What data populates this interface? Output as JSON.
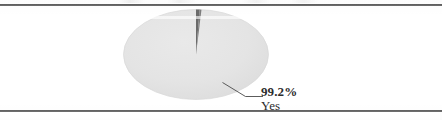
{
  "figure": {
    "background_color": "#ffffff",
    "rule_color": "#5d5d5d",
    "top_rule_label": "figure-top-rule",
    "bottom_rule_label": "figure-bottom-rule"
  },
  "chart_data": {
    "type": "pie",
    "title": "",
    "subtitle": "",
    "xlabel": "",
    "ylabel": "",
    "grid": false,
    "legend_position": "none",
    "style": "flat-ellipse-3d",
    "start_angle_deg": 0,
    "direction": "clockwise",
    "categories": [
      "Yes",
      "No"
    ],
    "values": [
      99.2,
      0.8
    ],
    "colors": [
      "#e3e3e3",
      "#6a6a6a"
    ],
    "labels": [
      {
        "category": "Yes",
        "value_text": "99.2%",
        "name_text": "Yes",
        "bold_value": true,
        "leader_line": true
      }
    ]
  },
  "callout": {
    "value": "99.2%",
    "name": "Yes"
  }
}
